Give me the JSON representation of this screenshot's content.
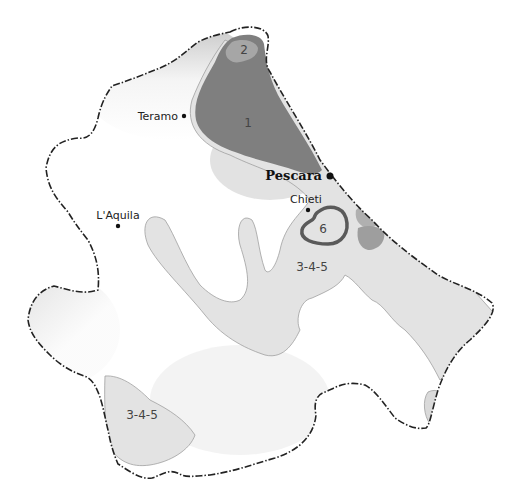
{
  "map": {
    "region": "Abruzzo",
    "colors": {
      "zone_1": "#7f7f7f",
      "zone_2": "#a6a6a6",
      "zone_3_4_5": "#e2e2e2",
      "zone_6_outline": "#5a5a5a",
      "relief_dark": "#9a9a9a",
      "boundary": "#222222",
      "background": "#ffffff"
    },
    "cities": [
      {
        "name": "Teramo",
        "major": false
      },
      {
        "name": "Pescara",
        "major": true
      },
      {
        "name": "Chieti",
        "major": false
      },
      {
        "name": "L'Aquila",
        "major": false
      }
    ],
    "zones": [
      {
        "id": "1",
        "label": "1"
      },
      {
        "id": "2",
        "label": "2"
      },
      {
        "id": "6",
        "label": "6"
      },
      {
        "id": "3-4-5-east",
        "label": "3-4-5"
      },
      {
        "id": "3-4-5-south",
        "label": "3-4-5"
      }
    ]
  }
}
